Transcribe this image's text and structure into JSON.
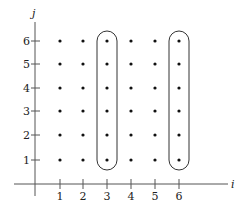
{
  "diagram": {
    "type": "lattice-point-grid",
    "axes": {
      "x_label": "i",
      "y_label": "j",
      "x_ticks": [
        "1",
        "2",
        "3",
        "4",
        "5",
        "6"
      ],
      "y_ticks": [
        "1",
        "2",
        "3",
        "4",
        "5",
        "6"
      ]
    },
    "points": {
      "columns": [
        1,
        2,
        3,
        4,
        5,
        6
      ],
      "rows": [
        1,
        2,
        3,
        4,
        5,
        6
      ],
      "count": 36
    },
    "highlighted_columns": [
      3,
      6
    ],
    "colors": {
      "ink": "#222222",
      "axis": "#555555",
      "background": "#ffffff"
    }
  }
}
